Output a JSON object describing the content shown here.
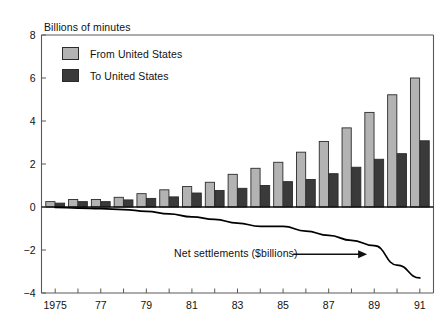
{
  "chart_data": {
    "type": "bar",
    "title": "",
    "subtitle": "",
    "ylabel": "Billions of minutes",
    "xlabel": "",
    "ylim": [
      -4,
      8
    ],
    "xlim": [
      1974.4,
      1991.6
    ],
    "yticks": [
      -4,
      -2,
      0,
      2,
      4,
      6,
      8
    ],
    "ytick_labels": [
      "−4",
      "−2",
      "0",
      "2",
      "4",
      "6",
      "8"
    ],
    "xticks": [
      1975,
      1976,
      1977,
      1978,
      1979,
      1980,
      1981,
      1982,
      1983,
      1984,
      1985,
      1986,
      1987,
      1988,
      1989,
      1990,
      1991
    ],
    "xtick_labels": [
      "1975",
      "",
      "77",
      "",
      "79",
      "",
      "81",
      "",
      "83",
      "",
      "85",
      "",
      "87",
      "",
      "89",
      "",
      "91"
    ],
    "grid": false,
    "legend_position": "upper-left",
    "categories": [
      1975,
      1976,
      1977,
      1978,
      1979,
      1980,
      1981,
      1982,
      1983,
      1984,
      1985,
      1986,
      1987,
      1988,
      1989,
      1990,
      1991
    ],
    "series": [
      {
        "name": "From United States",
        "color": "#b3b3b3",
        "edge_color": "#2b2b2b",
        "values": [
          0.25,
          0.35,
          0.35,
          0.45,
          0.62,
          0.8,
          0.95,
          1.15,
          1.52,
          1.8,
          2.08,
          2.55,
          3.05,
          3.68,
          4.4,
          5.22,
          6.0
        ]
      },
      {
        "name": "To United States",
        "color": "#3a3a3a",
        "edge_color": "#2b2b2b",
        "values": [
          0.18,
          0.25,
          0.25,
          0.33,
          0.4,
          0.47,
          0.65,
          0.77,
          0.87,
          1.0,
          1.18,
          1.28,
          1.55,
          1.85,
          2.22,
          2.48,
          3.08
        ]
      }
    ],
    "line_series": {
      "name": "Net settlements ($billions)",
      "color": "#000000",
      "x": [
        1975,
        1976,
        1977,
        1978,
        1979,
        1980,
        1981,
        1982,
        1983,
        1984,
        1985,
        1986,
        1987,
        1988,
        1989,
        1990,
        1991
      ],
      "values": [
        -0.02,
        -0.05,
        -0.08,
        -0.12,
        -0.2,
        -0.32,
        -0.46,
        -0.58,
        -0.75,
        -0.9,
        -0.9,
        -1.12,
        -1.32,
        -1.55,
        -1.8,
        -2.7,
        -3.3
      ]
    },
    "annotations": [
      {
        "text": "Net settlements ($billions)",
        "x": 1983.2,
        "y": -2.2,
        "arrow_to_x": 1988.6,
        "arrow_to_y": -2.2
      }
    ]
  },
  "axis": {
    "y_label_text": "Billions of minutes"
  },
  "legend": {
    "items": [
      {
        "label": "From United States",
        "color": "#b3b3b3"
      },
      {
        "label": "To United States",
        "color": "#3a3a3a"
      }
    ]
  }
}
